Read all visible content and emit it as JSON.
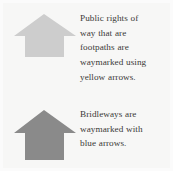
{
  "figure": {
    "background_color": "#f7f7f6",
    "text_color": "#3b3a38",
    "rows": [
      {
        "id": "footpath",
        "icon_name": "up-arrow-waymark-yellow",
        "icon_color": "#cdcdcd",
        "text": "Public rights of way that are footpaths are waymarked using yellow arrows.",
        "lines": [
          "Public rights of",
          "way that are",
          "footpaths are",
          "waymarked using",
          "yellow arrows."
        ]
      },
      {
        "id": "bridleway",
        "icon_name": "up-arrow-waymark-blue",
        "icon_color": "#8a8a8a",
        "text": "Bridleways are waymarked with blue arrows.",
        "lines": [
          "Bridleways are",
          "waymarked with",
          "blue arrows."
        ]
      }
    ]
  }
}
